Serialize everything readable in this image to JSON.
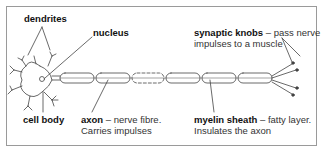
{
  "diagram": {
    "labels": {
      "dendrites": {
        "term": "dendrites"
      },
      "nucleus": {
        "term": "nucleus"
      },
      "synaptic_knobs": {
        "term": "synaptic knobs",
        "desc1": " – pass nerve",
        "desc2": "impulses to a muscle"
      },
      "cell_body": {
        "term": "cell body"
      },
      "axon": {
        "term": "axon",
        "desc1": " – nerve fibre.",
        "desc2": "Carries impulses"
      },
      "myelin_sheath": {
        "term": "myelin sheath",
        "desc1": " – fatty layer.",
        "desc2": "Insulates the axon"
      }
    },
    "colors": {
      "line": "#444444",
      "border": "#9a9a9a",
      "text": "#222222"
    }
  }
}
